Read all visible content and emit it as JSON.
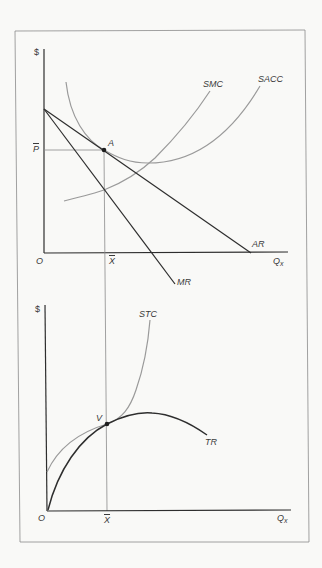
{
  "figure": {
    "colors": {
      "background": "#f9f9f7",
      "frame": "#8a8a8a",
      "axis": "#2e2e2e",
      "dark_curve": "#2e2e2e",
      "light_curve": "#9a9a9a",
      "guide_line": "#8a8a8a"
    }
  },
  "top_panel": {
    "y_axis_label": "$",
    "x_axis_label_main": "Q",
    "x_axis_label_sub": "x",
    "origin_label": "O",
    "price_label": "P",
    "quantity_label": "X",
    "point_label": "A",
    "curves": {
      "smc": "SMC",
      "sacc": "SACC",
      "ar": "AR",
      "mr": "MR"
    }
  },
  "bottom_panel": {
    "y_axis_label": "$",
    "x_axis_label_main": "Q",
    "x_axis_label_sub": "x",
    "origin_label": "O",
    "quantity_label": "X",
    "point_label": "V",
    "curves": {
      "stc": "STC",
      "tr": "TR"
    }
  }
}
